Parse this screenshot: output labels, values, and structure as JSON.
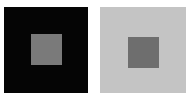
{
  "figure": {
    "panels": [
      {
        "name": "dark-background",
        "background": "#050505",
        "inner_color": "#7a7a7a"
      },
      {
        "name": "light-background",
        "background": "#c4c4c4",
        "inner_color": "#6e6e6e"
      }
    ]
  }
}
